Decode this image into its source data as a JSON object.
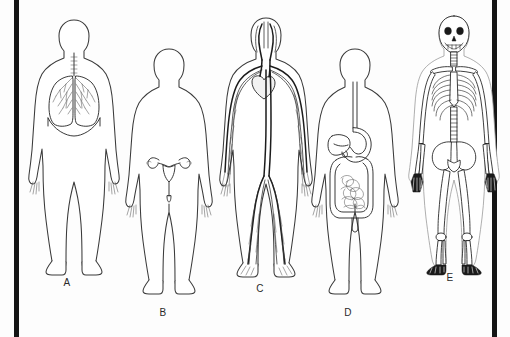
{
  "diagram": {
    "background_color": "#fdfdfd",
    "frame": {
      "left_bar_color": "#151515",
      "right_bar_color": "#151515",
      "left_bar_x": 14,
      "right_bar_x": 492,
      "bar_width": 5
    },
    "line_color": "#3a3a3a",
    "figures": [
      {
        "id": "A",
        "label": "A",
        "system": "respiratory-system",
        "description": "Human body outline with lungs, trachea, bronchi and diaphragm",
        "organs": [
          "trachea",
          "left-lung",
          "right-lung",
          "bronchial-tree",
          "diaphragm"
        ],
        "label_x": 67,
        "label_y": 277
      },
      {
        "id": "B",
        "label": "B",
        "system": "reproductive-system",
        "description": "Human body outline with female reproductive organs",
        "organs": [
          "uterus",
          "fallopian-tubes",
          "ovaries",
          "vagina"
        ],
        "label_x": 163,
        "label_y": 307
      },
      {
        "id": "C",
        "label": "C",
        "system": "circulatory-system",
        "description": "Human body outline with heart, arteries and veins throughout the body",
        "organs": [
          "heart",
          "aorta",
          "carotid-arteries",
          "arteries",
          "veins"
        ],
        "label_x": 260,
        "label_y": 283
      },
      {
        "id": "D",
        "label": "D",
        "system": "digestive-system",
        "description": "Human body outline with esophagus, stomach, liver, small and large intestine",
        "organs": [
          "esophagus",
          "stomach",
          "liver",
          "large-intestine",
          "small-intestine",
          "rectum"
        ],
        "label_x": 348,
        "label_y": 307
      },
      {
        "id": "E",
        "label": "E",
        "system": "skeletal-system",
        "description": "Human skeleton with skull, ribcage, spine, pelvis and limb bones",
        "organs": [
          "skull",
          "ribcage",
          "spine",
          "pelvis",
          "femur",
          "tibia",
          "humerus",
          "hand-bones",
          "foot-bones"
        ],
        "label_x": 450,
        "label_y": 272
      }
    ]
  }
}
